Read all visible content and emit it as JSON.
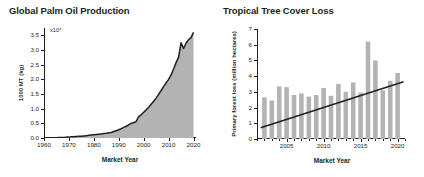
{
  "figure": {
    "background": "#ffffff",
    "ink_color": "#231f20",
    "bar_color": "#b3b3b3",
    "area_fill": "#b3b3b3"
  },
  "panels": [
    {
      "title": "Global Palm Oil Production",
      "xlabel": "Market Year",
      "ylabel": "1000 MT (kg)",
      "exponent": "x10⁴"
    },
    {
      "title": "Tropical Tree Cover Loss",
      "xlabel": "Market Year",
      "ylabel": "Primary forest loss (million hectares)"
    }
  ],
  "chart_data": [
    {
      "type": "area",
      "title": "Global Palm Oil Production",
      "xlabel": "Market Year",
      "ylabel": "1000 MT (kg)",
      "y_multiplier": "x10⁴",
      "xlim": [
        1960,
        2021
      ],
      "ylim": [
        0.0,
        3.75
      ],
      "xticks": [
        1960,
        1970,
        1980,
        1990,
        2000,
        2010,
        2020
      ],
      "xtick_labels": [
        "1960",
        "1970",
        "1980",
        "1990",
        "2000",
        "2010",
        "2020"
      ],
      "yticks": [
        0.0,
        0.5,
        1.0,
        1.5,
        2.0,
        2.5,
        3.0,
        3.5
      ],
      "ytick_labels": [
        "0.0",
        "0.5",
        "1.0",
        "1.5",
        "2.0",
        "2.5",
        "3.0",
        "3.5"
      ],
      "grid": false,
      "legend": "none",
      "x": [
        1964,
        1965,
        1966,
        1967,
        1968,
        1969,
        1970,
        1971,
        1972,
        1973,
        1974,
        1975,
        1976,
        1977,
        1978,
        1979,
        1980,
        1981,
        1982,
        1983,
        1984,
        1985,
        1986,
        1987,
        1988,
        1989,
        1990,
        1991,
        1992,
        1993,
        1994,
        1995,
        1996,
        1997,
        1998,
        1999,
        2000,
        2001,
        2002,
        2003,
        2004,
        2005,
        2006,
        2007,
        2008,
        2009,
        2010,
        2011,
        2012,
        2013,
        2014,
        2015,
        2016,
        2017,
        2018,
        2019,
        2020
      ],
      "values": [
        0.01,
        0.01,
        0.02,
        0.02,
        0.02,
        0.03,
        0.03,
        0.04,
        0.04,
        0.05,
        0.06,
        0.06,
        0.07,
        0.08,
        0.09,
        0.1,
        0.11,
        0.12,
        0.13,
        0.14,
        0.15,
        0.16,
        0.18,
        0.19,
        0.22,
        0.25,
        0.28,
        0.32,
        0.36,
        0.4,
        0.45,
        0.5,
        0.52,
        0.57,
        0.73,
        0.79,
        0.88,
        0.96,
        1.05,
        1.15,
        1.25,
        1.36,
        1.49,
        1.62,
        1.75,
        1.88,
        2.0,
        2.15,
        2.35,
        2.57,
        2.75,
        3.25,
        3.05,
        3.23,
        3.35,
        3.42,
        3.6
      ]
    },
    {
      "type": "bar",
      "title": "Tropical Tree Cover Loss",
      "xlabel": "Market Year",
      "ylabel": "Primary forest loss (million hectares)",
      "xlim": [
        2001,
        2021
      ],
      "ylim": [
        0,
        7
      ],
      "xticks": [
        2005,
        2010,
        2015,
        2020
      ],
      "xtick_labels": [
        "2005",
        "2010",
        "2015",
        "2020"
      ],
      "yticks": [
        0,
        1,
        2,
        3,
        4,
        5,
        6,
        7
      ],
      "ytick_labels": [
        "0",
        "1",
        "2",
        "3",
        "4",
        "5",
        "6",
        "7"
      ],
      "grid": false,
      "legend": "none",
      "categories": [
        2002,
        2003,
        2004,
        2005,
        2006,
        2007,
        2008,
        2009,
        2010,
        2011,
        2012,
        2013,
        2014,
        2015,
        2016,
        2017,
        2018,
        2019,
        2020
      ],
      "values": [
        2.65,
        2.45,
        3.35,
        3.3,
        2.8,
        2.9,
        2.7,
        2.8,
        3.25,
        2.75,
        3.5,
        3.0,
        3.6,
        2.95,
        6.2,
        5.0,
        3.1,
        3.7,
        4.2
      ],
      "series": [
        {
          "name": "Primary forest loss",
          "values": [
            2.65,
            2.45,
            3.35,
            3.3,
            2.8,
            2.9,
            2.7,
            2.8,
            3.25,
            2.75,
            3.5,
            3.0,
            3.6,
            2.95,
            6.2,
            5.0,
            3.1,
            3.7,
            4.2
          ]
        },
        {
          "name": "Trend line",
          "type": "line",
          "x": [
            2001.5,
            2020.8
          ],
          "values": [
            0.72,
            3.65
          ]
        }
      ],
      "annotations": [
        "Black linear trend line rising from about 0.7 to about 3.7 million hectares"
      ]
    }
  ]
}
